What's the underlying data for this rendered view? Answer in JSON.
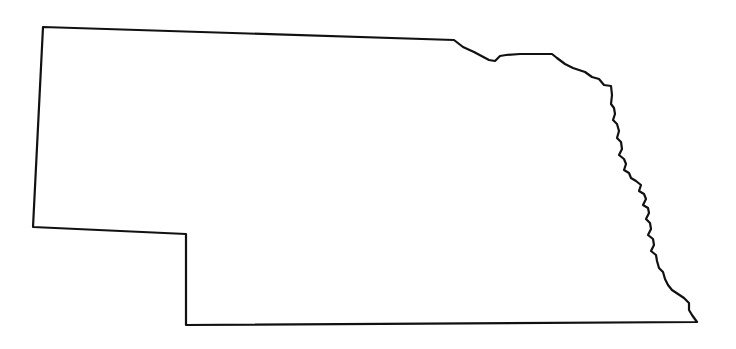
{
  "document": {
    "kind": "map",
    "title": "Nebraska outline map",
    "subject": "Nebraska",
    "region_type": "U.S. state",
    "projection_note": "simple outline silhouette, no projection graticule",
    "width": 736,
    "height": 349
  },
  "canvas": {
    "background_color": "#ffffff",
    "width": 736,
    "height": 349
  },
  "style": {
    "outline_color": "#111111",
    "fill_color": "#ffffff",
    "stroke_width": 2.2,
    "stroke_linejoin": "round"
  },
  "labels": {
    "visible_text": [],
    "note": "No text, legend, scale bar, compass rose, or graticule is rendered in this image."
  },
  "map_data": {
    "type": "outline",
    "feature_name": "Nebraska",
    "feature_count": 1,
    "viewbox": "0 0 736 349",
    "landmarks": {
      "northwest_corner": [
        43,
        27
      ],
      "panhandle_southwest_corner": [
        33,
        227
      ],
      "panhandle_southeast_corner": [
        186,
        234
      ],
      "panhandle_bottom": [
        186,
        325
      ],
      "southeast_tip": [
        697,
        322
      ],
      "missouri_river_notch_top": [
        455,
        41
      ]
    },
    "outline_path": "M 43 27 L 454 40 L 463 47 L 474 52 L 489 60 L 495 61 L 500 56 L 506 55 L 520 54 L 536 54 L 552 54 L 557 58 L 565 64 L 573 68 L 585 72 L 592 77 L 599 79 L 604 85 L 611 86 L 612 95 L 611 104 L 614 108 L 615 114 L 613 120 L 617 124 L 619 131 L 617 138 L 621 142 L 622 149 L 619 155 L 624 159 L 626 164 L 624 170 L 629 173 L 631 178 L 636 181 L 641 185 L 639 191 L 644 194 L 646 199 L 643 205 L 648 208 L 649 213 L 646 219 L 650 223 L 651 229 L 648 235 L 653 239 L 654 245 L 651 251 L 656 255 L 657 261 L 659 268 L 663 272 L 665 279 L 668 285 L 672 290 L 678 294 L 684 298 L 689 303 L 689 310 L 692 315 L 697 322 L 186 325 L 186 234 L 33 227 Z",
    "bounding_box": {
      "x_min": 33,
      "y_min": 27,
      "x_max": 697,
      "y_max": 325
    }
  }
}
